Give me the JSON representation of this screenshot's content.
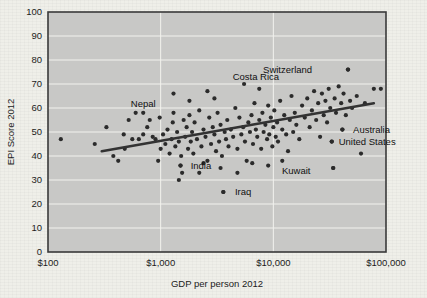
{
  "chart_data": {
    "type": "scatter",
    "title": "",
    "xlabel": "GDP per person 2012",
    "ylabel": "EPI Score 2012",
    "xscale": "log",
    "yscale": "linear",
    "xlim": [
      100,
      100000
    ],
    "ylim": [
      0,
      100
    ],
    "grid": true,
    "legend": "none",
    "x_tick_labels": [
      "$100",
      "$1,000",
      "$10,000",
      "$100,000"
    ],
    "x_tick_values": [
      100,
      1000,
      10000,
      100000
    ],
    "y_tick_labels": [
      "0",
      "10",
      "20",
      "30",
      "40",
      "50",
      "60",
      "70",
      "80",
      "90",
      "100"
    ],
    "y_tick_values": [
      0,
      10,
      20,
      30,
      40,
      50,
      60,
      70,
      80,
      90,
      100
    ],
    "trendline": {
      "type": "linear-on-log-x",
      "x_start": 300,
      "y_start": 42,
      "x_end": 78000,
      "y_end": 62
    },
    "annotations": [
      {
        "label": "Nepal",
        "x": 700,
        "y": 62,
        "anchor": "middle",
        "dot": false
      },
      {
        "label": "Costa Rica",
        "x": 7000,
        "y": 73,
        "anchor": "middle",
        "dot": false
      },
      {
        "label": "Switzerland",
        "x": 24000,
        "y": 76,
        "anchor": "end",
        "dot": true,
        "dot_x": 46000,
        "dot_y": 76
      },
      {
        "label": "Australia",
        "x": 47000,
        "y": 51,
        "anchor": "start",
        "dot": true,
        "dot_x": 41000,
        "dot_y": 51
      },
      {
        "label": "United States",
        "x": 35000,
        "y": 46,
        "anchor": "start",
        "dot": true,
        "dot_x": 33000,
        "dot_y": 46
      },
      {
        "label": "India",
        "x": 1700,
        "y": 36,
        "anchor": "start",
        "dot": true,
        "dot_x": 1500,
        "dot_y": 36
      },
      {
        "label": "Iraq",
        "x": 4200,
        "y": 25,
        "anchor": "start",
        "dot": true,
        "dot_x": 3600,
        "dot_y": 25
      },
      {
        "label": "Kuwait",
        "x": 11000,
        "y": 34,
        "anchor": "start",
        "dot": true,
        "dot_x": 34000,
        "dot_y": 35
      }
    ],
    "points": [
      [
        130,
        47
      ],
      [
        330,
        52
      ],
      [
        420,
        38
      ],
      [
        470,
        49
      ],
      [
        520,
        55
      ],
      [
        560,
        47
      ],
      [
        600,
        58
      ],
      [
        640,
        47
      ],
      [
        700,
        49
      ],
      [
        760,
        52
      ],
      [
        800,
        55
      ],
      [
        850,
        48
      ],
      [
        900,
        47
      ],
      [
        950,
        38
      ],
      [
        980,
        56
      ],
      [
        1000,
        43
      ],
      [
        1050,
        49
      ],
      [
        1100,
        45
      ],
      [
        1150,
        51
      ],
      [
        1200,
        41
      ],
      [
        1250,
        47
      ],
      [
        1280,
        54
      ],
      [
        1300,
        58
      ],
      [
        1350,
        44
      ],
      [
        1400,
        50
      ],
      [
        1450,
        46
      ],
      [
        1500,
        36
      ],
      [
        1520,
        40
      ],
      [
        1550,
        33
      ],
      [
        1600,
        55
      ],
      [
        1650,
        48
      ],
      [
        1700,
        52
      ],
      [
        1750,
        43
      ],
      [
        1800,
        57
      ],
      [
        1850,
        46
      ],
      [
        1900,
        50
      ],
      [
        1950,
        41
      ],
      [
        2000,
        54
      ],
      [
        2100,
        47
      ],
      [
        2200,
        59
      ],
      [
        2300,
        44
      ],
      [
        2400,
        51
      ],
      [
        2500,
        48
      ],
      [
        2600,
        38
      ],
      [
        2700,
        56
      ],
      [
        2800,
        45
      ],
      [
        2900,
        52
      ],
      [
        3000,
        49
      ],
      [
        3100,
        42
      ],
      [
        3200,
        58
      ],
      [
        3300,
        46
      ],
      [
        3400,
        53
      ],
      [
        3500,
        40
      ],
      [
        3600,
        25
      ],
      [
        3700,
        50
      ],
      [
        3800,
        47
      ],
      [
        3900,
        55
      ],
      [
        4000,
        44
      ],
      [
        4200,
        51
      ],
      [
        4400,
        48
      ],
      [
        4600,
        60
      ],
      [
        4800,
        43
      ],
      [
        5000,
        56
      ],
      [
        5200,
        49
      ],
      [
        5400,
        52
      ],
      [
        5600,
        46
      ],
      [
        5800,
        38
      ],
      [
        6000,
        54
      ],
      [
        6200,
        50
      ],
      [
        6400,
        57
      ],
      [
        6600,
        45
      ],
      [
        6800,
        62
      ],
      [
        7000,
        51
      ],
      [
        7200,
        48
      ],
      [
        7500,
        55
      ],
      [
        7800,
        43
      ],
      [
        8000,
        58
      ],
      [
        8200,
        50
      ],
      [
        8500,
        53
      ],
      [
        8800,
        47
      ],
      [
        9000,
        61
      ],
      [
        9200,
        49
      ],
      [
        9500,
        56
      ],
      [
        9800,
        44
      ],
      [
        10000,
        52
      ],
      [
        10200,
        59
      ],
      [
        10500,
        48
      ],
      [
        10800,
        54
      ],
      [
        11000,
        46
      ],
      [
        11500,
        63
      ],
      [
        12000,
        51
      ],
      [
        12500,
        57
      ],
      [
        13000,
        49
      ],
      [
        13500,
        42
      ],
      [
        14000,
        55
      ],
      [
        14500,
        65
      ],
      [
        15000,
        50
      ],
      [
        15500,
        58
      ],
      [
        16000,
        53
      ],
      [
        17000,
        47
      ],
      [
        18000,
        61
      ],
      [
        19000,
        56
      ],
      [
        20000,
        64
      ],
      [
        21000,
        52
      ],
      [
        22000,
        59
      ],
      [
        23000,
        67
      ],
      [
        24000,
        55
      ],
      [
        25000,
        62
      ],
      [
        26000,
        48
      ],
      [
        27000,
        66
      ],
      [
        28000,
        57
      ],
      [
        29000,
        63
      ],
      [
        30000,
        54
      ],
      [
        31000,
        68
      ],
      [
        32000,
        60
      ],
      [
        33000,
        46
      ],
      [
        34000,
        35
      ],
      [
        35000,
        64
      ],
      [
        36000,
        58
      ],
      [
        38000,
        69
      ],
      [
        40000,
        62
      ],
      [
        41000,
        51
      ],
      [
        42000,
        66
      ],
      [
        44000,
        57
      ],
      [
        46000,
        76
      ],
      [
        48000,
        63
      ],
      [
        50000,
        60
      ],
      [
        55000,
        65
      ],
      [
        60000,
        41
      ],
      [
        65000,
        62
      ],
      [
        78000,
        68
      ],
      [
        90000,
        68
      ],
      [
        1300,
        66
      ],
      [
        2600,
        67
      ],
      [
        5500,
        70
      ],
      [
        7500,
        68
      ],
      [
        3000,
        64
      ],
      [
        1800,
        63
      ],
      [
        2200,
        33
      ],
      [
        1450,
        30
      ],
      [
        6500,
        37
      ],
      [
        9000,
        36
      ],
      [
        12000,
        38
      ],
      [
        2400,
        37
      ],
      [
        3400,
        35
      ],
      [
        4800,
        33
      ],
      [
        700,
        58
      ],
      [
        480,
        43
      ],
      [
        380,
        40
      ],
      [
        260,
        45
      ]
    ]
  }
}
